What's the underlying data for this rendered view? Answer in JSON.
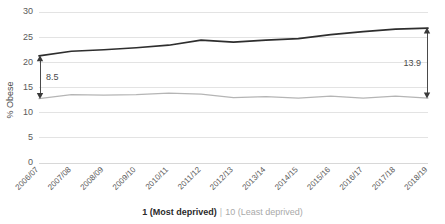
{
  "chart_data": {
    "type": "line",
    "title": "",
    "xlabel": "",
    "ylabel": "% Obese",
    "ylim": [
      0,
      30
    ],
    "yticks": [
      0,
      5,
      10,
      15,
      20,
      25,
      30
    ],
    "grid": true,
    "legend_position": "bottom",
    "categories": [
      "2006/07",
      "2007/08",
      "2008/09",
      "2009/10",
      "2010/11",
      "2011/12",
      "2012/13",
      "2013/14",
      "2014/15",
      "2015/16",
      "2016/17",
      "2017/18",
      "2018/19"
    ],
    "series": [
      {
        "name": "1 (Most deprived)",
        "color": "#2e2e2e",
        "values": [
          21.3,
          22.2,
          22.5,
          22.9,
          23.4,
          24.4,
          24.0,
          24.4,
          24.7,
          25.5,
          26.1,
          26.6,
          26.8
        ]
      },
      {
        "name": "10 (Least deprived)",
        "color": "#b5b5b5",
        "values": [
          12.8,
          13.6,
          13.5,
          13.6,
          13.9,
          13.7,
          13.0,
          13.2,
          12.9,
          13.3,
          12.9,
          13.3,
          12.9
        ]
      }
    ],
    "annotations": [
      {
        "label": "8.5",
        "category": "2006/07",
        "from_value": 12.8,
        "to_value": 21.3,
        "style": "double-arrow"
      },
      {
        "label": "13.9",
        "category": "2018/19",
        "from_value": 12.9,
        "to_value": 26.8,
        "style": "double-arrow"
      }
    ]
  },
  "legend": {
    "most_deprived": "1 (Most deprived)",
    "separator": "|",
    "least_deprived": "10 (Least deprived)"
  },
  "colors": {
    "series_dark": "#2e2e2e",
    "series_light": "#b5b5b5",
    "gridline": "#e3e3e3",
    "text": "#5a5a5a"
  }
}
